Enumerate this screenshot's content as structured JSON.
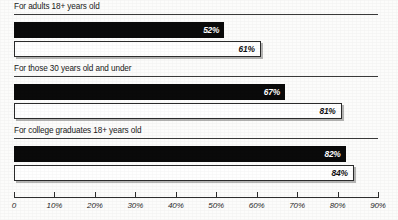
{
  "chart_data": {
    "type": "bar",
    "orientation": "horizontal",
    "title": "",
    "xlabel": "",
    "ylabel": "",
    "xlim": [
      0,
      90
    ],
    "grid": false,
    "legend_position": "none",
    "tick_labels": [
      "0",
      "10%",
      "20%",
      "30%",
      "40%",
      "50%",
      "60%",
      "70%",
      "80%",
      "90%"
    ],
    "tick_values": [
      0,
      10,
      20,
      30,
      40,
      50,
      60,
      70,
      80,
      90
    ],
    "categories": [
      "For adults 18+ years old",
      "For those 30 years old and under",
      "For college graduates 18+ years old"
    ],
    "series": [
      {
        "name": "dark",
        "style": "filled-black",
        "values": [
          52,
          67,
          82
        ],
        "labels": [
          "52%",
          "61%",
          "67%"
        ]
      },
      {
        "name": "light",
        "style": "outlined-white",
        "values": [
          61,
          81,
          84
        ],
        "labels": [
          "61%",
          "81%",
          "84%"
        ]
      }
    ],
    "groups": [
      {
        "label": "For adults 18+ years old",
        "bars": [
          {
            "value": 52,
            "label": "52%",
            "style": "dark"
          },
          {
            "value": 61,
            "label": "61%",
            "style": "light"
          }
        ]
      },
      {
        "label": "For those 30 years old and under",
        "bars": [
          {
            "value": 67,
            "label": "67%",
            "style": "dark"
          },
          {
            "value": 81,
            "label": "81%",
            "style": "light"
          }
        ]
      },
      {
        "label": "For college graduates 18+ years old",
        "bars": [
          {
            "value": 82,
            "label": "82%",
            "style": "dark"
          },
          {
            "value": 84,
            "label": "84%",
            "style": "light"
          }
        ]
      }
    ]
  },
  "colors": {
    "dark_bar": "#0a0a0a",
    "light_bar": "#ffffff",
    "light_bar_border": "#2b2b2b",
    "axis": "#2e2e2e",
    "text": "#1a1a1a",
    "background": "#fcfcfb"
  }
}
